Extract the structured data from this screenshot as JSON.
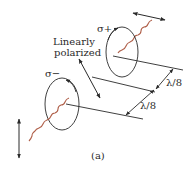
{
  "diagram": {
    "caption": "(a)",
    "labels": {
      "sigma_plus": "σ+",
      "sigma_minus": "σ−",
      "linearly": "Linearly",
      "polarized": "polarized",
      "lambda_upper": "λ/8",
      "lambda_lower": "λ/8"
    },
    "colors": {
      "line": "#2a2a2a",
      "wave": "#b0604a",
      "background": "#ffffff"
    }
  }
}
